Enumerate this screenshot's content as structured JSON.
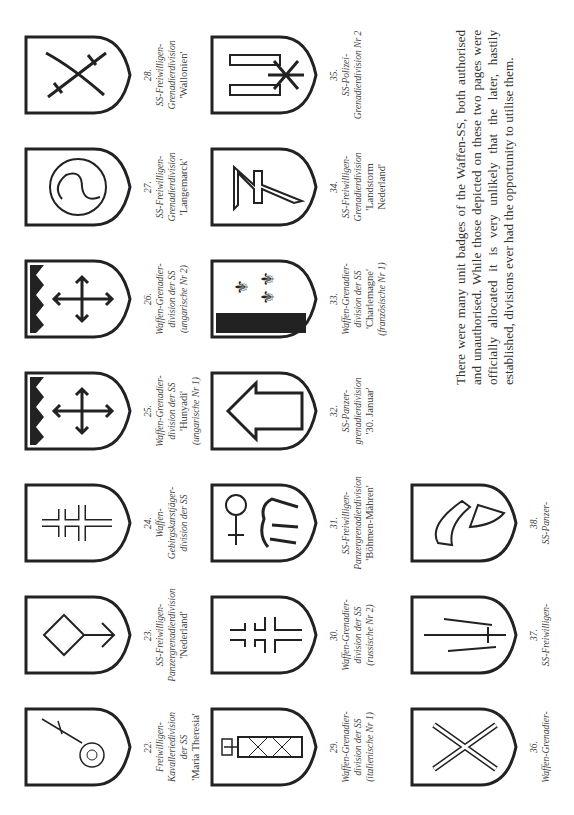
{
  "page": {
    "orientation": "rotated-90-ccw",
    "rows": [
      {
        "badges": [
          {
            "num": "22.",
            "lines": [
              "Freiwilligen-",
              "Kavalleriedivision",
              "der SS"
            ],
            "name": "'Maria Theresia'",
            "emblem": "cornflower-icon"
          },
          {
            "num": "23.",
            "lines": [
              "SS-Freiwilligen-",
              "Panzergrenadierdivision"
            ],
            "name": "'Nederland'",
            "emblem": "wolfsangel-rune-icon"
          },
          {
            "num": "24.",
            "lines": [
              "Waffen-",
              "Gebirgskarstjäger-",
              "division der SS"
            ],
            "name": "",
            "emblem": "edelweiss-cross-icon"
          },
          {
            "num": "25.",
            "lines": [
              "Waffen-Grenadier-",
              "division der SS"
            ],
            "name": "'Hunyadi'",
            "sub": "(ungarische Nr 1)",
            "emblem": "arrow-cross-crown-icon"
          },
          {
            "num": "26.",
            "lines": [
              "Waffen-Grenadier-",
              "division der SS"
            ],
            "name": "",
            "sub": "(ungarische Nr 2)",
            "emblem": "arrow-cross-crown-icon"
          },
          {
            "num": "27.",
            "lines": [
              "SS-Freiwilligen-",
              "Grenadierdivision"
            ],
            "name": "'Langemarck'",
            "emblem": "triskelion-icon"
          },
          {
            "num": "28.",
            "lines": [
              "SS-Freiwilligen-",
              "Grenadierdivision"
            ],
            "name": "'Wallonien'",
            "emblem": "crossed-swords-icon"
          }
        ]
      },
      {
        "badges": [
          {
            "num": "29.",
            "lines": [
              "Waffen-Grenadier-",
              "division der SS"
            ],
            "name": "",
            "sub": "(italienische Nr 1)",
            "emblem": "fasces-icon"
          },
          {
            "num": "30.",
            "lines": [
              "Waffen-Grenadier-",
              "division der SS"
            ],
            "name": "",
            "sub": "(russische Nr 2)",
            "emblem": "double-cross-icon"
          },
          {
            "num": "31.",
            "lines": [
              "SS-Freiwilligen-",
              "Panzergrenadierdivision"
            ],
            "name": "'Böhmen-Mähren'",
            "emblem": "lion-cross-icon"
          },
          {
            "num": "32.",
            "lines": [
              "SS-Panzer-",
              "grenadierdivision"
            ],
            "name": "'30. Januar'",
            "emblem": "arrow-rune-icon"
          },
          {
            "num": "33.",
            "lines": [
              "Waffen-Grenadier-",
              "division der SS"
            ],
            "name": "'Charlemagne'",
            "sub": "(französische Nr 1)",
            "emblem": "fleur-de-lis-icon"
          },
          {
            "num": "34.",
            "lines": [
              "SS-Freiwilligen-",
              "Grenadierdivision"
            ],
            "name": "'Landstorm",
            "name2": "Nederland'",
            "emblem": "wolfsangel-zigzag-icon"
          },
          {
            "num": "35.",
            "lines": [
              "SS-Polizei-",
              "Grenadierdivision Nr 2"
            ],
            "name": "",
            "emblem": "police-rune-icon"
          }
        ]
      },
      {
        "badges": [
          {
            "num": "36.",
            "lines": [
              "Waffen-Grenadier-"
            ],
            "name": "",
            "emblem": "crossed-grenades-icon"
          },
          {
            "num": "37.",
            "lines": [
              "SS-Freiwilligen-"
            ],
            "name": "",
            "emblem": "sword-ship-icon"
          },
          {
            "num": "38.",
            "lines": [
              "SS-Panzer-"
            ],
            "name": "",
            "emblem": "winged-helmet-icon"
          }
        ]
      }
    ],
    "paragraph": "There were many unit badges of the Waffen-SS, both authorised and unauthorised. While those depicted on these two pages were officially allocated it is very unlikely that the later, hastily established, divisions ever had the opportunity to utilise them."
  }
}
